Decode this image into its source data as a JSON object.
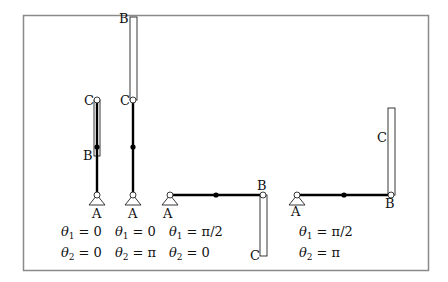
{
  "figure": {
    "frame": {
      "x": 23,
      "y": 15,
      "width": 405,
      "height": 255,
      "color": "#808080"
    },
    "configurations": [
      {
        "id": "config-1",
        "A": [
          97,
          195
        ],
        "B": [
          97,
          155
        ],
        "C": [
          97,
          100
        ],
        "mid": [
          97,
          147
        ],
        "rect": {
          "x": 94,
          "y": 100,
          "w": 6,
          "h": 56
        },
        "labels": {
          "A": "A",
          "B": "B",
          "C": "C"
        },
        "theta1": "θ₁ = 0",
        "theta2": "θ₂ = 0",
        "theta1_sym": "θ",
        "theta1_sub": "1",
        "theta1_val": "= 0",
        "theta2_sym": "θ",
        "theta2_sub": "2",
        "theta2_val": "= 0"
      },
      {
        "id": "config-2",
        "A": [
          133,
          195
        ],
        "B": [
          133,
          17
        ],
        "C": [
          133,
          100
        ],
        "mid": [
          133,
          147
        ],
        "rect": {
          "x": 130,
          "y": 17,
          "w": 7,
          "h": 83
        },
        "labels": {
          "A": "A",
          "B": "B",
          "C": "C"
        },
        "theta1_sym": "θ",
        "theta1_sub": "1",
        "theta1_val": "= 0",
        "theta2_sym": "θ",
        "theta2_sub": "2",
        "theta2_val": "= π"
      },
      {
        "id": "config-3",
        "A": [
          170,
          195
        ],
        "B": [
          263,
          195
        ],
        "C": [
          263,
          256
        ],
        "mid": [
          216,
          195
        ],
        "rect": {
          "x": 260,
          "y": 195,
          "w": 7,
          "h": 61
        },
        "labels": {
          "A": "A",
          "B": "B",
          "C": "C"
        },
        "theta1_sym": "θ",
        "theta1_sub": "1",
        "theta1_val": "= π/2",
        "theta2_sym": "θ",
        "theta2_sub": "2",
        "theta2_val": "= 0"
      },
      {
        "id": "config-4",
        "A": [
          297,
          195
        ],
        "B": [
          391,
          195
        ],
        "C": [
          391,
          108
        ],
        "mid": [
          344,
          195
        ],
        "rect": {
          "x": 388,
          "y": 108,
          "w": 7,
          "h": 87
        },
        "labels": {
          "A": "A",
          "B": "B",
          "C": "C"
        },
        "theta1_sym": "θ",
        "theta1_sub": "1",
        "theta1_val": "= π/2",
        "theta2_sym": "θ",
        "theta2_sub": "2",
        "theta2_val": "= π"
      }
    ]
  }
}
